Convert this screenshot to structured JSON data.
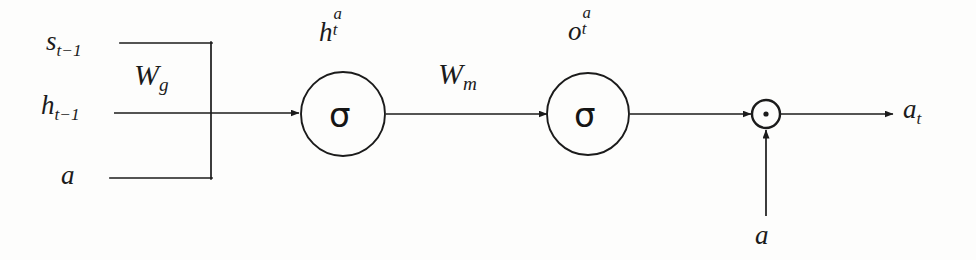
{
  "diagram": {
    "background_color": "#fdfdfc",
    "stroke_color": "#1b1b1b",
    "inputs": [
      {
        "id": "s_prev",
        "base": "s",
        "sub": "t-1",
        "x": 46,
        "y": 28
      },
      {
        "id": "h_prev",
        "base": "h",
        "sub": "t-1",
        "x": 41,
        "y": 92
      },
      {
        "id": "a_left",
        "base": "a",
        "sub": "",
        "x": 61,
        "y": 162
      }
    ],
    "weights": [
      {
        "id": "W_g",
        "base": "W",
        "sub": "g"
      },
      {
        "id": "W_m",
        "base": "W",
        "sub": "m"
      }
    ],
    "nodes": [
      {
        "id": "h_t_a",
        "base": "h",
        "sup": "a",
        "sub": "t",
        "glyph": "σ",
        "cx": 343,
        "cy": 114,
        "r": 42
      },
      {
        "id": "o_t_a",
        "base": "o",
        "sup": "a",
        "sub": "t",
        "glyph": "σ",
        "cx": 588,
        "cy": 114,
        "r": 41
      }
    ],
    "operator": {
      "id": "elementwise-product",
      "symbol": "⊙",
      "cx": 766,
      "cy": 114,
      "r": 14
    },
    "bottom_input": {
      "id": "a_bottom",
      "base": "a",
      "x": 755,
      "y": 222
    },
    "output": {
      "id": "a_t",
      "base": "a",
      "sub": "t",
      "x": 903,
      "y": 96
    }
  },
  "labels": {
    "s_prev_base": "s",
    "s_prev_sub": "t−1",
    "h_prev_base": "h",
    "h_prev_sub": "t−1",
    "a_left": "a",
    "w_g_base": "W",
    "w_g_sub": "g",
    "w_m_base": "W",
    "w_m_sub": "m",
    "h_t_base": "h",
    "h_t_sup": "a",
    "h_t_sub": "t",
    "o_t_base": "o",
    "o_t_sup": "a",
    "o_t_sub": "t",
    "sigma_1": "σ",
    "sigma_2": "σ",
    "a_bottom": "a",
    "a_t_base": "a",
    "a_t_sub": "t"
  }
}
